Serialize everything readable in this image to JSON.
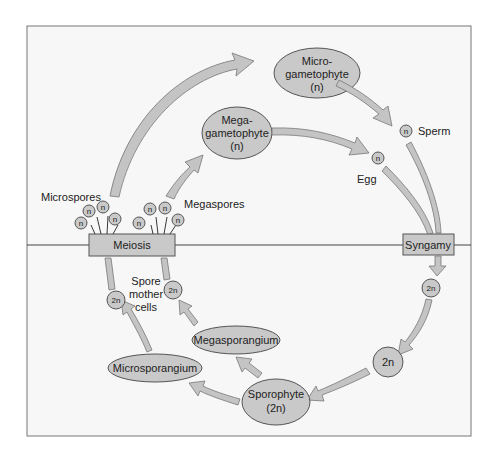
{
  "diagram": {
    "type": "plant-life-cycle",
    "colors": {
      "background": "#ffffff",
      "frame_fill": "#f7f7f7",
      "frame_border": "#777777",
      "node_fill": "#c9c9c9",
      "node_border": "#555555",
      "arrow_fill": "#c4c4c4",
      "text": "#222222"
    },
    "phases": {
      "upper": "haploid (n)",
      "lower": "diploid (2n)"
    },
    "nodes": {
      "microgametophyte": {
        "line1": "Micro-",
        "line2": "gametophyte",
        "line3": "(n)"
      },
      "megagametophyte": {
        "line1": "Mega-",
        "line2": "gametophyte",
        "line3": "(n)"
      },
      "sperm_cell": {
        "label": "n"
      },
      "sperm_label": "Sperm",
      "egg_cell": {
        "label": "n"
      },
      "egg_label": "Egg",
      "meiosis": {
        "label": "Meiosis"
      },
      "syngamy": {
        "label": "Syngamy"
      },
      "zygote": {
        "label": "2n"
      },
      "embryo": {
        "label": "2n"
      },
      "sporophyte": {
        "line1": "Sporophyte",
        "line2": "(2n)"
      },
      "megasporangium": {
        "label": "Megasporangium"
      },
      "microsporangium": {
        "label": "Microsporangium"
      },
      "spore_mother_cell_left": {
        "label": "2n"
      },
      "spore_mother_cell_right": {
        "label": "2n"
      },
      "spore_mother_cells_label": {
        "line1": "Spore",
        "line2": "mother",
        "line3": "cells"
      },
      "microspores_label": "Microspores",
      "megaspores_label": "Megaspores",
      "microspores": [
        "n",
        "n",
        "n",
        "n"
      ],
      "megaspores": [
        "n",
        "n",
        "n",
        "n"
      ]
    },
    "edges": [
      {
        "from": "meiosis",
        "to": "microgametophyte",
        "via": "microspores"
      },
      {
        "from": "meiosis",
        "to": "megagametophyte",
        "via": "megaspores"
      },
      {
        "from": "microgametophyte",
        "to": "sperm"
      },
      {
        "from": "megagametophyte",
        "to": "egg"
      },
      {
        "from": "sperm",
        "to": "syngamy"
      },
      {
        "from": "egg",
        "to": "syngamy"
      },
      {
        "from": "syngamy",
        "to": "zygote"
      },
      {
        "from": "zygote",
        "to": "embryo"
      },
      {
        "from": "embryo",
        "to": "sporophyte"
      },
      {
        "from": "sporophyte",
        "to": "megasporangium"
      },
      {
        "from": "sporophyte",
        "to": "microsporangium"
      },
      {
        "from": "megasporangium",
        "to": "spore_mother_cell_right"
      },
      {
        "from": "microsporangium",
        "to": "spore_mother_cell_left"
      },
      {
        "from": "spore_mother_cell_left",
        "to": "meiosis"
      },
      {
        "from": "spore_mother_cell_right",
        "to": "meiosis"
      }
    ]
  }
}
